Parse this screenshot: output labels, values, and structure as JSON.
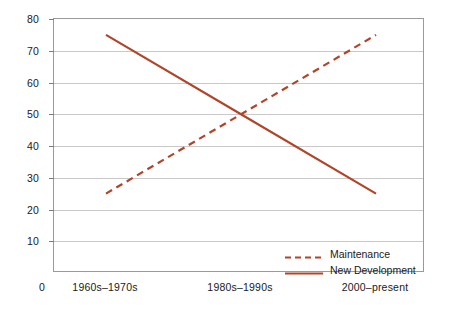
{
  "chart_data": {
    "type": "line",
    "title": "",
    "xlabel": "",
    "ylabel": "",
    "categories": [
      "1960s–1970s",
      "1980s–1990s",
      "2000–present"
    ],
    "series": [
      {
        "name": "Maintenance",
        "values": [
          25,
          50,
          75
        ],
        "style": "dashed",
        "color": "#B0452A"
      },
      {
        "name": "New Development",
        "values": [
          75,
          50,
          25
        ],
        "style": "solid",
        "color": "#B0452A"
      }
    ],
    "ylim": [
      0,
      80
    ],
    "ytick_values": [
      0,
      10,
      20,
      30,
      40,
      50,
      60,
      70,
      80
    ],
    "ytick_labels": [
      "0",
      "10",
      "20",
      "30",
      "40",
      "50",
      "60",
      "70",
      "80"
    ],
    "grid": true,
    "legend_position": "bottom-right-inside",
    "axis_color": "#9a9a9a",
    "grid_color": "#c9c9c9",
    "background": "#ffffff"
  },
  "axis": {
    "y": {
      "t80": "80",
      "t70": "70",
      "t60": "60",
      "t50": "50",
      "t40": "40",
      "t30": "30",
      "t20": "20",
      "t10": "10",
      "t0": "0"
    },
    "x": {
      "c0": "1960s–1970s",
      "c1": "1980s–1990s",
      "c2": "2000–present"
    }
  },
  "legend": {
    "items": [
      {
        "label": "Maintenance"
      },
      {
        "label": "New Development"
      }
    ]
  }
}
